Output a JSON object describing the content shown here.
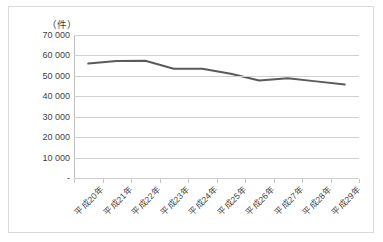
{
  "chart_data": {
    "type": "line",
    "title": "",
    "subtitle": "",
    "unit_label": "（件）",
    "xlabel": "",
    "ylabel": "",
    "categories": [
      "平成20年",
      "平成21年",
      "平成22年",
      "平成23年",
      "平成24年",
      "平成25年",
      "平成26年",
      "平成27年",
      "平成28年",
      "平成29年"
    ],
    "series": [
      {
        "name": "件数",
        "values": [
          56000,
          57300,
          57400,
          53500,
          53500,
          51000,
          47700,
          48800,
          47300,
          45800
        ],
        "color": "#5a5a5a"
      }
    ],
    "ylim": [
      0,
      70000
    ],
    "ytick_values": [
      70000,
      60000,
      50000,
      40000,
      30000,
      20000,
      10000,
      0
    ],
    "ytick_labels": [
      "70 000",
      "60 000",
      "50 000",
      "40 000",
      "30 000",
      "20 000",
      "10 000",
      "-"
    ],
    "grid": true,
    "grid_axis": "y",
    "legend": false,
    "legend_position": "none",
    "markers": false,
    "line_width": 2,
    "plot_background": "#ffffff",
    "gridline_color": "#d0d0d0",
    "border_color": "#d9d9d9",
    "text_color": "#3f3f3f"
  }
}
